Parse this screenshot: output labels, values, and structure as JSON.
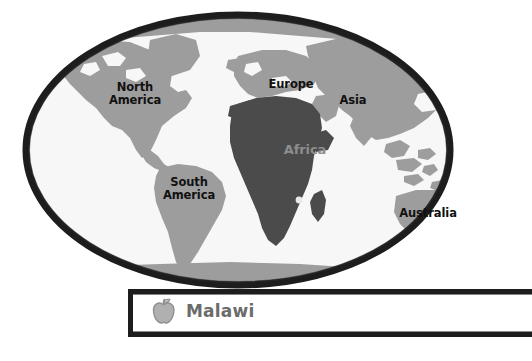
{
  "map": {
    "name": "world-map",
    "style": "hand-drawn ellipse world map",
    "ocean_color": "#f7f7f7",
    "land_color": "#9d9d9d",
    "highlight_color": "#4b4b4b",
    "border_color": "#1d1d1d",
    "highlighted_continent": "Africa",
    "marker": {
      "name": "malawi-location-dot",
      "color": "#e8e8e8"
    },
    "labels": [
      {
        "id": "north-america",
        "text": "North\nAmerica"
      },
      {
        "id": "south-america",
        "text": "South\nAmerica"
      },
      {
        "id": "europe",
        "text": "Europe"
      },
      {
        "id": "asia",
        "text": "Asia"
      },
      {
        "id": "africa",
        "text": "Africa"
      },
      {
        "id": "australia",
        "text": "Australia"
      }
    ]
  },
  "info_bar": {
    "title": "Malawi",
    "icon": "apple-icon",
    "icon_color": "#a8a8a8",
    "title_color": "#6b6b6b",
    "border_color": "#1d1d1d",
    "background": "#ffffff"
  }
}
